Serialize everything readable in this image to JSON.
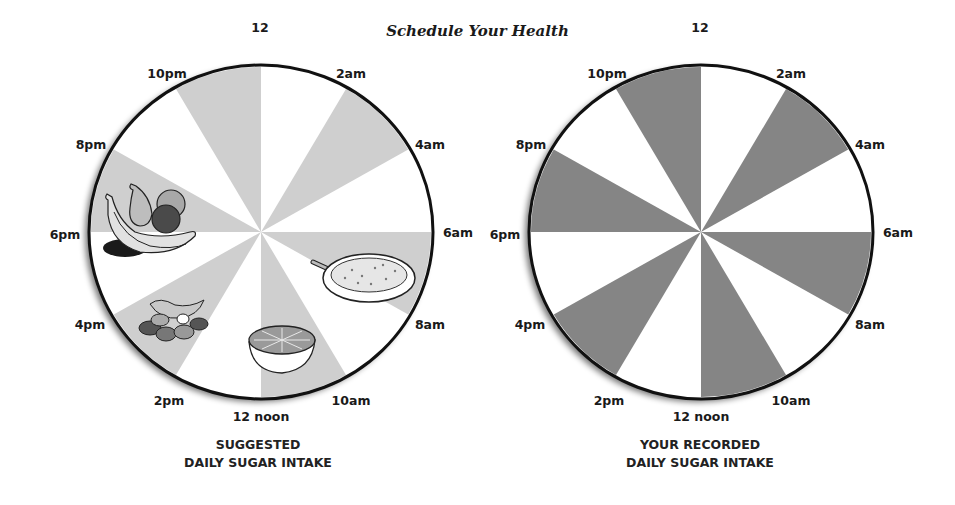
{
  "title": "Schedule Your Health",
  "clock_labels": [
    "12",
    "2am",
    "4am",
    "6am",
    "8am",
    "10am",
    "12 noon",
    "2pm",
    "4pm",
    "6pm",
    "8pm",
    "10pm"
  ],
  "charts": [
    {
      "id": "suggested",
      "caption_line1": "SUGGESTED",
      "caption_line2": "DAILY SUGAR INTAKE",
      "shade_color": "#cfcfcf",
      "illustrations": [
        "fruit-bowl",
        "oatmeal-bowl",
        "orange-half",
        "nuts-and-raisins"
      ]
    },
    {
      "id": "recorded",
      "caption_line1": "YOUR RECORDED",
      "caption_line2": "DAILY SUGAR INTAKE",
      "shade_color": "#858585"
    }
  ],
  "chart_data": [
    {
      "type": "pie",
      "title": "SUGGESTED DAILY SUGAR INTAKE",
      "categories": [
        "12-2am",
        "2am-4am",
        "4am-6am",
        "6am-8am",
        "8am-10am",
        "10am-12 noon",
        "12 noon-2pm",
        "2pm-4pm",
        "4pm-6pm",
        "6pm-8pm",
        "8pm-10pm",
        "10pm-12"
      ],
      "values": [
        1,
        1,
        1,
        1,
        1,
        1,
        1,
        1,
        1,
        1,
        1,
        1
      ],
      "shaded": [
        false,
        true,
        false,
        true,
        false,
        true,
        false,
        true,
        false,
        true,
        false,
        true
      ],
      "shade_color": "#cfcfcf",
      "annotations": [
        "fruit bowl at 6pm-8pm",
        "oatmeal bowl at 6am-8am",
        "orange half at 10am-12 noon",
        "nuts and raisins at 2pm-4pm"
      ]
    },
    {
      "type": "pie",
      "title": "YOUR RECORDED DAILY SUGAR INTAKE",
      "categories": [
        "12-2am",
        "2am-4am",
        "4am-6am",
        "6am-8am",
        "8am-10am",
        "10am-12 noon",
        "12 noon-2pm",
        "2pm-4pm",
        "4pm-6pm",
        "6pm-8pm",
        "8pm-10pm",
        "10pm-12"
      ],
      "values": [
        1,
        1,
        1,
        1,
        1,
        1,
        1,
        1,
        1,
        1,
        1,
        1
      ],
      "shaded": [
        false,
        true,
        false,
        true,
        false,
        true,
        false,
        true,
        false,
        true,
        false,
        true
      ],
      "shade_color": "#858585"
    }
  ]
}
